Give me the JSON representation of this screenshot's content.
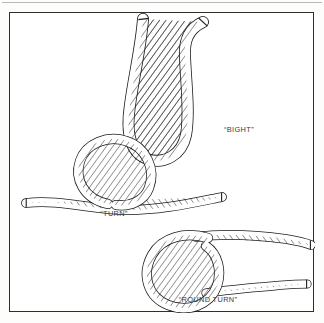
{
  "figure": {
    "kind": "rope-terminology-diagram",
    "background_color": "#fdfdfc",
    "frame_color": "#2e2e30",
    "ink_color": "#1d1d1f",
    "rope_fill": "#ffffff",
    "label_color": "#3a3a3c",
    "items": [
      {
        "id": "bight",
        "label": "“BIGHT”",
        "label_x": 214,
        "label_y": 119,
        "description": "U-shaped doubled rope with both ends rising upward"
      },
      {
        "id": "turn",
        "label": "“TURN”",
        "label_x": 104,
        "label_y": 203,
        "description": "Single loop of rope crossing over a horizontal standing part"
      },
      {
        "id": "round-turn",
        "label": "“ROUND TURN”",
        "label_x": 198,
        "label_y": 289,
        "description": "Rope passed twice around, both ends leading off to the right"
      }
    ]
  }
}
